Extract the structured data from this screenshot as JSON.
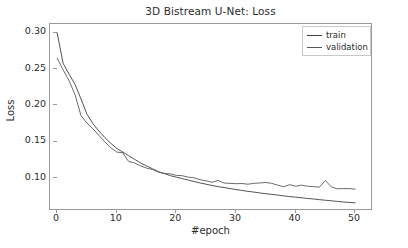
{
  "chart_data": {
    "type": "line",
    "title": "3D Bistream U-Net: Loss",
    "xlabel": "#epoch",
    "ylabel": "Loss",
    "xlim": [
      -1.2,
      53.0
    ],
    "ylim": [
      0.055,
      0.312
    ],
    "grid": false,
    "legend_position": "upper right",
    "xticks": [
      0,
      10,
      20,
      30,
      40,
      50
    ],
    "xtick_labels": [
      "0",
      "10",
      "20",
      "30",
      "40",
      "50"
    ],
    "yticks": [
      0.1,
      0.15,
      0.2,
      0.25,
      0.3
    ],
    "ytick_labels": [
      "0.10",
      "0.15",
      "0.20",
      "0.25",
      "0.30"
    ],
    "x": [
      0,
      1,
      2,
      3,
      4,
      5,
      6,
      7,
      8,
      9,
      10,
      11,
      12,
      13,
      14,
      15,
      16,
      17,
      18,
      19,
      20,
      21,
      22,
      23,
      24,
      25,
      26,
      27,
      28,
      29,
      30,
      31,
      32,
      33,
      34,
      35,
      36,
      37,
      38,
      39,
      40,
      41,
      42,
      43,
      44,
      45,
      46,
      47,
      48,
      49,
      50
    ],
    "series": [
      {
        "name": "train",
        "color": "#3f3f3f",
        "values": [
          0.3,
          0.258,
          0.243,
          0.229,
          0.209,
          0.188,
          0.175,
          0.165,
          0.156,
          0.148,
          0.141,
          0.136,
          0.131,
          0.126,
          0.121,
          0.117,
          0.113,
          0.109,
          0.1065,
          0.1035,
          0.1015,
          0.0995,
          0.0975,
          0.0955,
          0.0935,
          0.0918,
          0.09,
          0.0885,
          0.0872,
          0.0858,
          0.0845,
          0.0833,
          0.082,
          0.081,
          0.0798,
          0.0788,
          0.0778,
          0.077,
          0.0758,
          0.0748,
          0.074,
          0.0732,
          0.0722,
          0.0715,
          0.0706,
          0.0698,
          0.069,
          0.0682,
          0.0674,
          0.0668,
          0.0662
        ]
      },
      {
        "name": "validation",
        "color": "#595959",
        "values": [
          0.265,
          0.249,
          0.234,
          0.215,
          0.186,
          0.176,
          0.168,
          0.159,
          0.15,
          0.142,
          0.136,
          0.135,
          0.123,
          0.121,
          0.117,
          0.114,
          0.112,
          0.1085,
          0.1065,
          0.106,
          0.104,
          0.1035,
          0.1015,
          0.1005,
          0.098,
          0.0965,
          0.0945,
          0.097,
          0.0935,
          0.093,
          0.0925,
          0.0928,
          0.0918,
          0.093,
          0.0935,
          0.0942,
          0.093,
          0.0905,
          0.0882,
          0.0912,
          0.089,
          0.0905,
          0.089,
          0.0885,
          0.0878,
          0.097,
          0.0882,
          0.0855,
          0.0858,
          0.0858,
          0.085
        ]
      }
    ]
  },
  "legend": {
    "items": [
      {
        "label": "train",
        "color": "#3f3f3f"
      },
      {
        "label": "validation",
        "color": "#595959"
      }
    ]
  },
  "axes": {
    "frame_color": "#9a9a9a"
  }
}
